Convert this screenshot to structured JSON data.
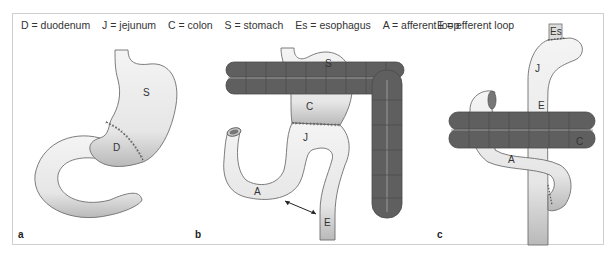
{
  "legend": {
    "left": [
      {
        "key": "D",
        "label": "D = duodenum"
      },
      {
        "key": "J",
        "label": "J = jejunum"
      },
      {
        "key": "C",
        "label": "C = colon"
      },
      {
        "key": "S",
        "label": "S = stomach"
      },
      {
        "key": "Es",
        "label": "Es = esophagus"
      },
      {
        "key": "A",
        "label": "A = afferent loop"
      }
    ],
    "right": {
      "key": "E",
      "label": "E = efferent loop"
    }
  },
  "panels": [
    {
      "id": "a",
      "letter": "a",
      "labels": {
        "S": "S",
        "D": "D"
      }
    },
    {
      "id": "b",
      "letter": "b",
      "labels": {
        "S": "S",
        "C": "C",
        "J": "J",
        "A": "A",
        "E": "E"
      }
    },
    {
      "id": "c",
      "letter": "c",
      "labels": {
        "Es": "Es",
        "J": "J",
        "E": "E",
        "C": "C",
        "A": "A"
      }
    }
  ],
  "colors": {
    "organ_fill": "#ececec",
    "organ_stroke": "#6e6e6e",
    "colon_fill": "#5f5f5f",
    "colon_stroke": "#4a4a4a",
    "frame": "#cfcfcf"
  }
}
